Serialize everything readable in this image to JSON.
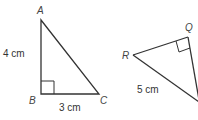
{
  "diagram": {
    "stroke_color": "#333333",
    "triangle_abc": {
      "vertices": {
        "A": {
          "label": "A",
          "x": 41,
          "y": 20
        },
        "B": {
          "label": "B",
          "x": 41,
          "y": 94
        },
        "C": {
          "label": "C",
          "x": 99,
          "y": 94
        }
      },
      "right_angle_at": "B",
      "sides": {
        "AB": "4 cm",
        "BC": "3 cm"
      }
    },
    "triangle_pqr": {
      "vertices": {
        "Q": {
          "label": "Q",
          "x": 188,
          "y": 37
        },
        "R": {
          "label": "R",
          "x": 133,
          "y": 55
        }
      },
      "right_angle_at": "Q",
      "sides": {
        "RP": "5 cm"
      }
    }
  }
}
